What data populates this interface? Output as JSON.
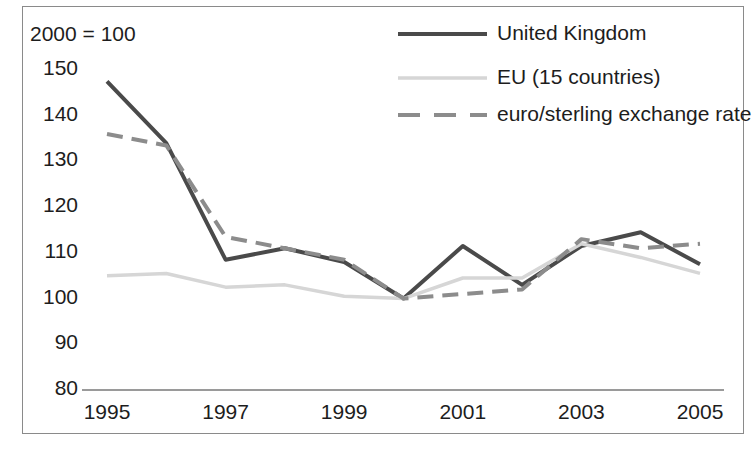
{
  "chart_data": {
    "type": "line",
    "title": "",
    "subtitle": "",
    "index_note": "2000 = 100",
    "xlabel": "",
    "ylabel": "",
    "x": [
      1995,
      1996,
      1997,
      1998,
      1999,
      2000,
      2001,
      2002,
      2003,
      2004,
      2005
    ],
    "categories": [
      "1995",
      "1996",
      "1997",
      "1998",
      "1999",
      "2000",
      "2001",
      "2002",
      "2003",
      "2004",
      "2005"
    ],
    "xticks": [
      "1995",
      "1997",
      "1999",
      "2001",
      "2003",
      "2005"
    ],
    "xtick_values": [
      1995,
      1997,
      1999,
      2001,
      2003,
      2005
    ],
    "yticks": [
      80,
      90,
      100,
      110,
      120,
      130,
      140,
      150
    ],
    "ytick_labels": [
      "80",
      "90",
      "100",
      "110",
      "120",
      "130",
      "140",
      "150"
    ],
    "ylim": [
      80,
      150
    ],
    "xlim": [
      1995,
      2005
    ],
    "grid": false,
    "legend_position": "top-right",
    "series": [
      {
        "name": "United Kingdom",
        "color": "#4a4a4a",
        "style": "solid",
        "width": 4,
        "values": [
          147.5,
          134.0,
          108.5,
          111.0,
          108.0,
          100.0,
          111.5,
          103.0,
          111.5,
          114.5,
          107.5
        ]
      },
      {
        "name": "EU (15 countries)",
        "color": "#d6d6d6",
        "style": "solid",
        "width": 3.5,
        "values": [
          105.0,
          105.5,
          102.5,
          103.0,
          100.5,
          100.0,
          104.5,
          104.5,
          112.0,
          109.0,
          105.5
        ]
      },
      {
        "name": "euro/sterling exchange rate",
        "color": "#8c8c8c",
        "style": "dashed",
        "width": 4,
        "values": [
          136.0,
          133.5,
          113.5,
          111.0,
          108.5,
          100.0,
          101.0,
          102.0,
          113.0,
          111.0,
          112.0
        ]
      }
    ]
  },
  "legend": {
    "entries": [
      {
        "label": "United Kingdom"
      },
      {
        "label": "EU (15 countries)"
      },
      {
        "label": "euro/sterling exchange rate"
      }
    ]
  },
  "axes": {
    "note": "2000 = 100"
  }
}
